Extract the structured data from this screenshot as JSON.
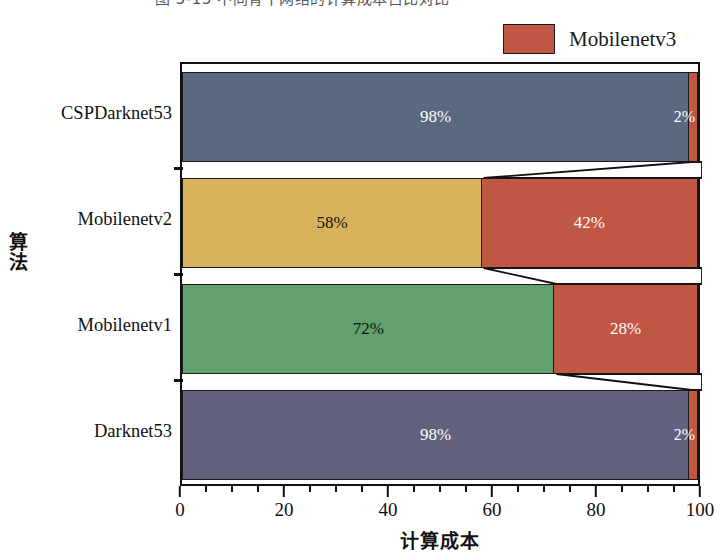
{
  "caption": {
    "text": "图 5-13  不同骨干网络的计算成本占比对比"
  },
  "legend": {
    "position": "top-right",
    "entries": [
      {
        "label": "Mobilenetv3",
        "color": "#bf5744"
      }
    ]
  },
  "axis": {
    "y_title": "算法",
    "x_title": "计算成本",
    "x_ticks": [
      "0",
      "20",
      "40",
      "60",
      "80",
      "100"
    ],
    "x_min": 0,
    "x_max": 100,
    "x_minor_step": 5
  },
  "chart_data": {
    "type": "bar",
    "orientation": "horizontal",
    "stacked": true,
    "stacked_percent": true,
    "title": "图 5-13  不同骨干网络的计算成本占比对比",
    "xlabel": "计算成本",
    "ylabel": "算法",
    "xlim": [
      0,
      100
    ],
    "grid": false,
    "legend_position": "top-right",
    "categories": [
      "CSPDarknet53",
      "Mobilenetv2",
      "Mobilenetv1",
      "Darknet53"
    ],
    "series": [
      {
        "name": "Backbone",
        "values": [
          98,
          58,
          72,
          98
        ],
        "colors": [
          "#5a6880",
          "#d9b35c",
          "#62a06d",
          "#61617d"
        ],
        "label_colors": [
          "light",
          "dark",
          "dark",
          "light"
        ],
        "labels": [
          "98%",
          "58%",
          "72%",
          "98%"
        ]
      },
      {
        "name": "Mobilenetv3",
        "values": [
          2,
          42,
          28,
          2
        ],
        "colors": [
          "#bf5744",
          "#bf5744",
          "#bf5744",
          "#bf5744"
        ],
        "label_colors": [
          "light",
          "light",
          "light",
          "light"
        ],
        "labels": [
          "2%",
          "42%",
          "28%",
          "2%"
        ]
      }
    ],
    "bars": [
      {
        "category": "CSPDarknet53",
        "segments": [
          {
            "name": "Backbone",
            "value": 98,
            "label": "98%",
            "color": "#5a6880",
            "text": "light"
          },
          {
            "name": "Mobilenetv3",
            "value": 2,
            "label": "2%",
            "color": "#bf5744",
            "text": "light"
          }
        ]
      },
      {
        "category": "Mobilenetv2",
        "segments": [
          {
            "name": "Backbone",
            "value": 58,
            "label": "58%",
            "color": "#d9b35c",
            "text": "dark"
          },
          {
            "name": "Mobilenetv3",
            "value": 42,
            "label": "42%",
            "color": "#bf5744",
            "text": "light"
          }
        ]
      },
      {
        "category": "Mobilenetv1",
        "segments": [
          {
            "name": "Backbone",
            "value": 72,
            "label": "72%",
            "color": "#62a06d",
            "text": "dark"
          },
          {
            "name": "Mobilenetv3",
            "value": 28,
            "label": "28%",
            "color": "#bf5744",
            "text": "light"
          }
        ]
      },
      {
        "category": "Darknet53",
        "segments": [
          {
            "name": "Backbone",
            "value": 98,
            "label": "98%",
            "color": "#61617d",
            "text": "light"
          },
          {
            "name": "Mobilenetv3",
            "value": 2,
            "label": "2%",
            "color": "#bf5744",
            "text": "light"
          }
        ]
      }
    ],
    "connectors": [
      {
        "from_bar": 0,
        "to_bar": 1,
        "from_x": 98,
        "to_x": 58
      },
      {
        "from_bar": 1,
        "to_bar": 2,
        "from_x": 58,
        "to_x": 72
      },
      {
        "from_bar": 2,
        "to_bar": 3,
        "from_x": 72,
        "to_x": 98
      }
    ]
  }
}
